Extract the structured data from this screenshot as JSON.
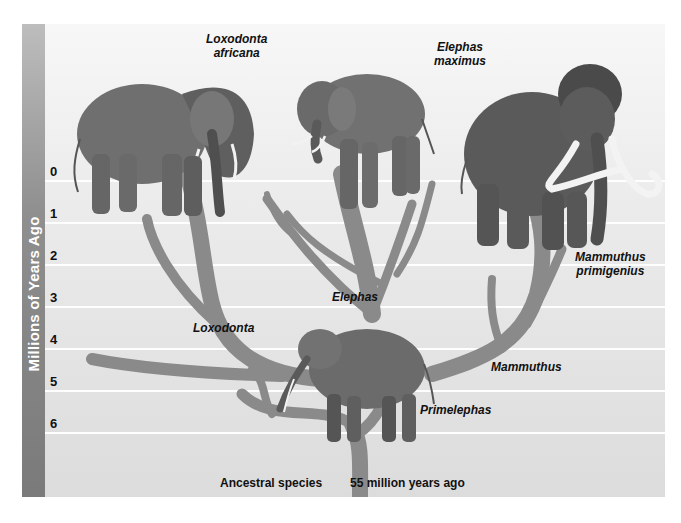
{
  "figure": {
    "axis_title": "Millions of Years Ago",
    "ticks": [
      "0",
      "1",
      "2",
      "3",
      "4",
      "5",
      "6"
    ],
    "species": [
      {
        "line1": "Loxodonta",
        "line2": "africana"
      },
      {
        "line1": "Elephas",
        "line2": "maximus"
      },
      {
        "line1": "Mammuthus",
        "line2": "primigenius"
      }
    ],
    "lineages": {
      "loxodonta": "Loxodonta",
      "elephas": "Elephas",
      "mammuthus": "Mammuthus",
      "primelephas": "Primelephas"
    },
    "captions": {
      "ancestral": "Ancestral species",
      "age": "55 million years ago"
    },
    "colors": {
      "branch": "#8a8a8a",
      "axis_bar": "#8f8f8f",
      "gridline": "#ffffff",
      "background": "#e6e6e6"
    }
  }
}
